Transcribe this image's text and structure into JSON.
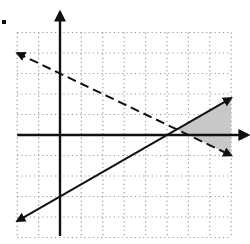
{
  "figure": {
    "title": "",
    "type": "graph of system of linear inequalities",
    "grid": {
      "x_min": -2,
      "x_max": 8,
      "y_min": -5,
      "y_max": 5,
      "step": 1
    },
    "axes": {
      "x_axis_arrow": "right",
      "y_axis_arrow": "up"
    },
    "lines": [
      {
        "name": "dashed-line",
        "equation": "y = -1/2 x + 3",
        "slope": -0.5,
        "intercept": 3,
        "style": "dashed",
        "from": [
          -2,
          4
        ],
        "to": [
          8,
          -1
        ]
      },
      {
        "name": "solid-line",
        "equation": "y = 3/5 x - 3",
        "slope": 0.6,
        "intercept": -3,
        "style": "solid",
        "from": [
          -2,
          -4.2
        ],
        "to": [
          8,
          1.8
        ]
      }
    ],
    "shaded_region": {
      "description": "between lines, right of their intersection",
      "vertices": [
        [
          5.4545,
          0.2727
        ],
        [
          8,
          1.8
        ],
        [
          8,
          -1
        ]
      ],
      "color": "#c8c8c8"
    },
    "marker_dot": {
      "position": "top-left",
      "color": "#111111"
    }
  },
  "colors": {
    "line": "#111111",
    "grid": "#9a9a9a",
    "shade": "#c8c8c8",
    "background": "#ffffff"
  }
}
